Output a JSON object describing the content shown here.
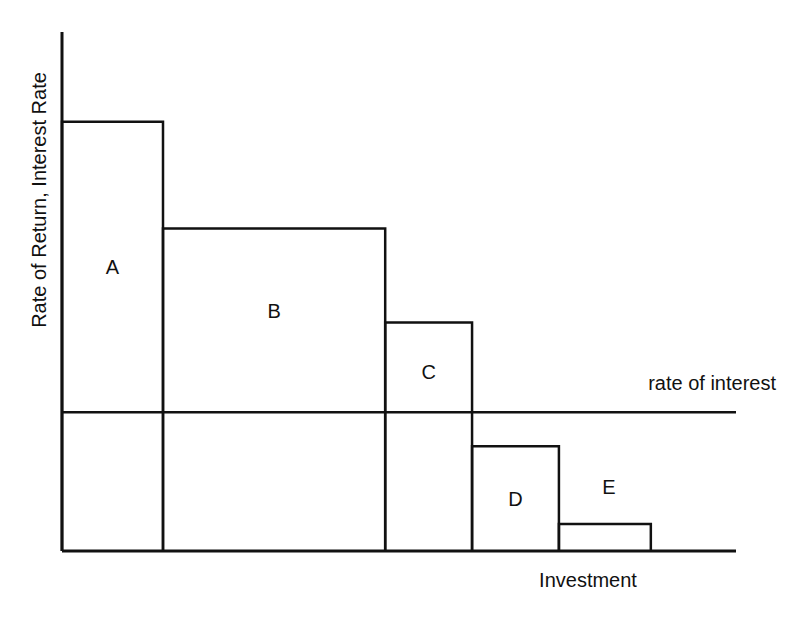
{
  "chart_data": {
    "type": "bar",
    "title": "",
    "xlabel": "Investment",
    "ylabel": "Rate of Return, Interest Rate",
    "grid": false,
    "legend": "none",
    "categories": [
      "A",
      "B",
      "C",
      "D",
      "E"
    ],
    "widths": [
      1.0,
      2.2,
      0.86,
      0.86,
      0.91
    ],
    "values": [
      4.3,
      3.23,
      2.29,
      1.05,
      0.27
    ],
    "ylim": [
      0,
      5.2
    ],
    "reference_line": {
      "label": "rate of interest",
      "value": 1.39
    }
  }
}
